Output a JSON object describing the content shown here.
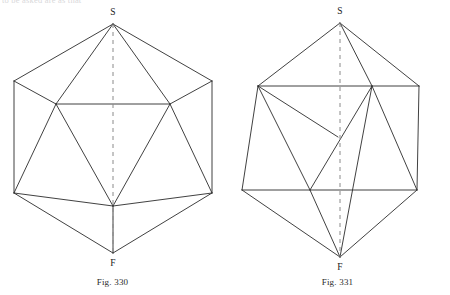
{
  "page": {
    "background": "#ffffff",
    "width": 450,
    "height": 295,
    "torn_header_text": "to be asked are as that"
  },
  "figures": [
    {
      "id": "fig-330",
      "caption": "Fig. 330",
      "apex_label": "S",
      "base_label": "F",
      "stroke_color": "#2b2b2b",
      "axis_color": "#8a8a8a",
      "description": "icosahedron-projection-vertex-first",
      "geometry": {
        "apex": [
          113,
          24
        ],
        "base": [
          113,
          253
        ],
        "upper_outer_left": [
          14,
          81
        ],
        "upper_outer_right": [
          212,
          81
        ],
        "lower_outer_left": [
          14,
          193
        ],
        "lower_outer_right": [
          212,
          193
        ],
        "upper_inner_left": [
          56,
          104
        ],
        "upper_inner_right": [
          170,
          104
        ],
        "lower_center": [
          113,
          206
        ],
        "axis_dash": "4 4"
      }
    },
    {
      "id": "fig-331",
      "caption": "Fig. 331",
      "apex_label": "S",
      "base_label": "F",
      "stroke_color": "#2b2b2b",
      "axis_color": "#8a8a8a",
      "description": "icosahedron-projection-rotated",
      "geometry": {
        "apex": [
          340,
          23
        ],
        "base": [
          340,
          257
        ],
        "upper_outer_left": [
          258,
          86
        ],
        "upper_outer_right": [
          419,
          86
        ],
        "lower_outer_left": [
          242,
          190
        ],
        "lower_outer_right": [
          417,
          190
        ],
        "upper_mid_right": [
          372,
          86
        ],
        "lower_mid_left": [
          310,
          190
        ],
        "center": [
          338,
          137
        ],
        "axis_dash": "4 4"
      }
    }
  ]
}
